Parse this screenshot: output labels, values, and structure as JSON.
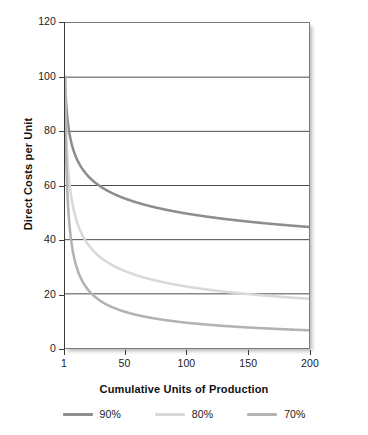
{
  "chart_data": {
    "type": "line",
    "title": "",
    "xlabel": "Cumulative Units of Production",
    "ylabel": "Direct Costs per Unit",
    "xlim": [
      1,
      200
    ],
    "ylim": [
      0,
      120
    ],
    "xticks": [
      "1",
      "50",
      "100",
      "150",
      "200"
    ],
    "xtick_values": [
      1,
      50,
      100,
      150,
      200
    ],
    "yticks": [
      "0",
      "20",
      "40",
      "60",
      "80",
      "100",
      "120"
    ],
    "ytick_values": [
      0,
      20,
      40,
      60,
      80,
      100,
      120
    ],
    "grid": "horizontal",
    "legend_position": "bottom",
    "first_unit_cost": 100,
    "series": [
      {
        "name": "90%",
        "rate": 0.9,
        "color": "#8e8e8e",
        "x": [
          1,
          2,
          5,
          10,
          20,
          30,
          40,
          50,
          60,
          80,
          100,
          120,
          140,
          160,
          180,
          200
        ],
        "values": [
          100.0,
          90.0,
          78.3,
          70.5,
          63.4,
          59.6,
          57.1,
          55.2,
          53.7,
          51.4,
          49.6,
          48.3,
          47.2,
          46.3,
          45.5,
          44.8
        ]
      },
      {
        "name": "80%",
        "rate": 0.8,
        "color": "#d9d9d9",
        "x": [
          1,
          2,
          5,
          10,
          20,
          30,
          40,
          50,
          60,
          80,
          100,
          120,
          140,
          160,
          180,
          200
        ],
        "values": [
          100.0,
          80.0,
          59.6,
          47.7,
          38.2,
          33.5,
          30.5,
          28.5,
          26.9,
          24.4,
          22.7,
          21.4,
          20.4,
          19.5,
          18.8,
          18.2
        ]
      },
      {
        "name": "70%",
        "rate": 0.7,
        "color": "#b3b3b3",
        "x": [
          1,
          2,
          5,
          10,
          20,
          30,
          40,
          50,
          60,
          80,
          100,
          120,
          140,
          160,
          180,
          200
        ],
        "values": [
          100.0,
          70.0,
          43.7,
          30.6,
          21.4,
          17.4,
          15.0,
          13.4,
          12.2,
          10.5,
          9.4,
          8.6,
          8.0,
          7.4,
          7.0,
          6.6
        ]
      }
    ],
    "legend": [
      {
        "label": "90%",
        "color": "#8e8e8e"
      },
      {
        "label": "80%",
        "color": "#d9d9d9"
      },
      {
        "label": "70%",
        "color": "#b3b3b3"
      }
    ]
  },
  "axes": {
    "y_title": "Direct Costs per Unit",
    "x_title": "Cumulative Units of Production"
  }
}
